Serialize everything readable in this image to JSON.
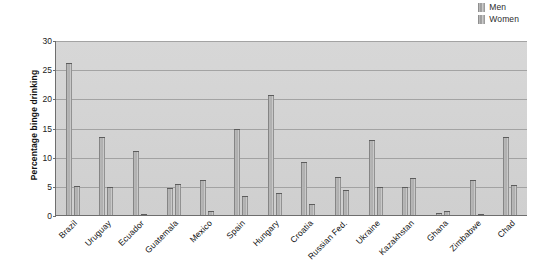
{
  "chart_data": {
    "type": "bar",
    "title": "",
    "xlabel": "",
    "ylabel": "Percentage binge drinking",
    "ylim": [
      0,
      30
    ],
    "yticks": [
      0,
      5,
      10,
      15,
      20,
      25,
      30
    ],
    "grid": true,
    "legend_position": "top-right",
    "categories": [
      "Brazil",
      "Uruguay",
      "Ecuador",
      "Guatemala",
      "Mexico",
      "Spain",
      "Hungary",
      "Croatia",
      "Russian Fed.",
      "Ukraine",
      "Kazakhstan",
      "Ghana",
      "Zimbabwe",
      "Chad"
    ],
    "series": [
      {
        "name": "Men",
        "color": "#9a9a9a",
        "values": [
          26.2,
          13.5,
          11.1,
          4.8,
          6.2,
          15.0,
          20.7,
          9.3,
          6.7,
          13.1,
          5.0,
          0.5,
          6.2,
          13.5
        ]
      },
      {
        "name": "Women",
        "color": "#9a9a9a",
        "values": [
          5.2,
          4.9,
          0.3,
          5.5,
          0.8,
          3.4,
          4.0,
          2.0,
          4.4,
          4.9,
          6.5,
          0.9,
          0.4,
          5.3
        ]
      }
    ]
  },
  "legend": {
    "items": [
      {
        "label": "Men",
        "swatch": "legend-swatch-men"
      },
      {
        "label": "Women",
        "swatch": "legend-swatch-women"
      }
    ]
  },
  "axis": {
    "y_title": "Percentage binge drinking"
  }
}
